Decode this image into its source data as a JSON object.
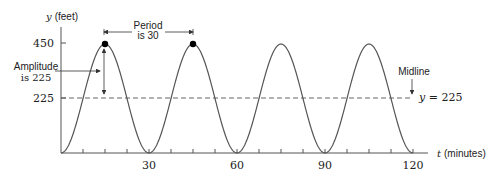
{
  "chart_data": {
    "type": "line",
    "title": "",
    "xlabel": "t (minutes)",
    "ylabel": "y (feet)",
    "x_label_var": "t",
    "x_label_unit": "(minutes)",
    "y_label_var": "y",
    "y_label_unit": "(feet)",
    "xlim": [
      0,
      120
    ],
    "ylim": [
      0,
      450
    ],
    "x_ticks": [
      30,
      60,
      90,
      120
    ],
    "x_tick_labels": [
      "30",
      "60",
      "90",
      "120"
    ],
    "x_minor_tick_step": 7.5,
    "y_ticks": [
      225,
      450
    ],
    "y_tick_labels": [
      "225",
      "450"
    ],
    "grid": false,
    "series": [
      {
        "name": "y = 225 - 225 cos(2πt/30)",
        "function": "225 - 225*cos(2*pi*t/30)",
        "x": [
          0,
          7.5,
          15,
          22.5,
          30,
          37.5,
          45,
          52.5,
          60,
          67.5,
          75,
          82.5,
          90,
          97.5,
          105,
          112.5,
          120
        ],
        "values": [
          0,
          225,
          450,
          225,
          0,
          225,
          450,
          225,
          0,
          225,
          450,
          225,
          0,
          225,
          450,
          225,
          0
        ]
      }
    ],
    "highlighted_points": [
      {
        "t": 15,
        "y": 450
      },
      {
        "t": 45,
        "y": 450
      }
    ],
    "midline": {
      "y": 225,
      "label": "y = 225",
      "style": "dashed"
    },
    "annotations": [
      {
        "text": "Period is 30",
        "lines": [
          "Period",
          "is 30"
        ],
        "from_t": 15,
        "to_t": 45
      },
      {
        "text": "Amplitude is 225",
        "lines": [
          "Amplitude",
          "is 225"
        ],
        "at_t": 15,
        "from_y": 225,
        "to_y": 450
      },
      {
        "text": "Midline",
        "points_to_y": 225
      }
    ],
    "legend": null
  },
  "labels": {
    "y_var": "y",
    "y_unit": "(feet)",
    "t_var": "t",
    "t_unit": "(minutes)",
    "y450": "450",
    "y225": "225",
    "x30": "30",
    "x60": "60",
    "x90": "90",
    "x120": "120",
    "period_line1": "Period",
    "period_line2": "is 30",
    "amp_line1": "Amplitude",
    "amp_line2": "is 225",
    "midline": "Midline",
    "midline_eq_var": "y",
    "midline_eq_rest": " = 225"
  },
  "colors": {
    "curve": "#555555",
    "axis": "#555555",
    "text": "#222222",
    "dot": "#000000"
  }
}
